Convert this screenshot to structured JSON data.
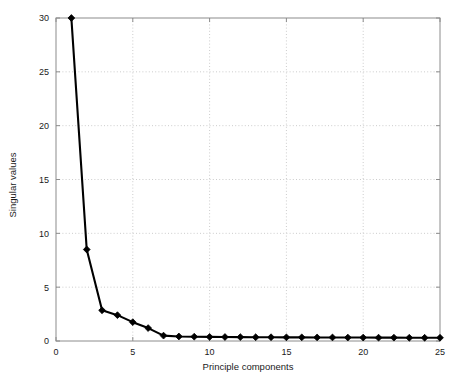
{
  "chart_data": {
    "type": "line",
    "title": "",
    "xlabel": "Principle components",
    "ylabel": "Singular values",
    "xlim": [
      0,
      25
    ],
    "ylim": [
      0,
      30
    ],
    "xticks": [
      0,
      5,
      10,
      15,
      20,
      25
    ],
    "yticks": [
      0,
      5,
      10,
      15,
      20,
      25,
      30
    ],
    "grid": true,
    "grid_style": "dotted",
    "legend": null,
    "marker": "diamond",
    "line_color": "#000000",
    "marker_color": "#000000",
    "grid_color": "#cccccc",
    "axis_color": "#808080",
    "background": "#ffffff",
    "x": [
      1,
      2,
      3,
      4,
      5,
      6,
      7,
      8,
      9,
      10,
      11,
      12,
      13,
      14,
      15,
      16,
      17,
      18,
      19,
      20,
      21,
      22,
      23,
      24,
      25
    ],
    "values": [
      30.0,
      8.5,
      2.85,
      2.4,
      1.75,
      1.2,
      0.5,
      0.42,
      0.4,
      0.38,
      0.37,
      0.36,
      0.35,
      0.35,
      0.34,
      0.34,
      0.33,
      0.33,
      0.32,
      0.32,
      0.31,
      0.31,
      0.3,
      0.3,
      0.3
    ],
    "series": [
      {
        "name": "Singular values",
        "values": [
          30.0,
          8.5,
          2.85,
          2.4,
          1.75,
          1.2,
          0.5,
          0.42,
          0.4,
          0.38,
          0.37,
          0.36,
          0.35,
          0.35,
          0.34,
          0.34,
          0.33,
          0.33,
          0.32,
          0.32,
          0.31,
          0.31,
          0.3,
          0.3,
          0.3
        ]
      }
    ]
  },
  "axes": {
    "x_title": "Principle components",
    "y_title": "Singular values",
    "x_tick_labels": [
      "0",
      "5",
      "10",
      "15",
      "20",
      "25"
    ],
    "y_tick_labels": [
      "0",
      "5",
      "10",
      "15",
      "20",
      "25",
      "30"
    ]
  }
}
